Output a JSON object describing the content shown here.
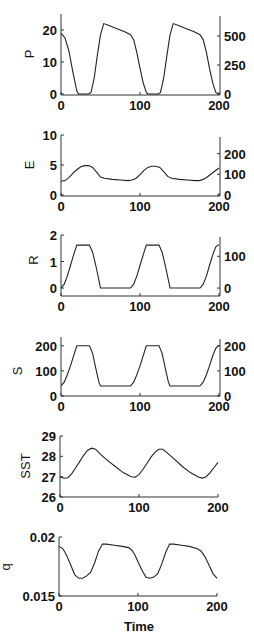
{
  "chart_data": [
    {
      "type": "line",
      "ylabel": "P",
      "xlabel": "",
      "xlim": [
        0,
        200
      ],
      "xticks": [
        0,
        100,
        200
      ],
      "ylim": [
        0,
        25
      ],
      "yticks": [
        0,
        10,
        20
      ],
      "right_axis": {
        "ylim": [
          0,
          690
        ],
        "yticks": [
          0,
          250,
          500
        ]
      },
      "x": [
        0,
        5,
        10,
        15,
        20,
        22,
        35,
        38,
        42,
        46,
        50,
        54,
        60,
        70,
        80,
        88,
        92,
        96,
        100,
        104,
        108,
        110,
        123,
        126,
        130,
        134,
        138,
        142,
        148,
        158,
        168,
        176,
        180,
        184,
        188,
        192,
        196,
        199
      ],
      "values": [
        19.0,
        17.5,
        13.5,
        7.0,
        1.0,
        0,
        0,
        0.5,
        5.0,
        12.0,
        18.5,
        22.0,
        21.5,
        20.5,
        19.5,
        18.5,
        17.0,
        13.0,
        8.0,
        3.5,
        0.5,
        0,
        0,
        0.5,
        5.0,
        12.0,
        18.5,
        22.0,
        21.5,
        20.5,
        19.5,
        18.5,
        17.0,
        13.0,
        8.0,
        3.5,
        0.5,
        0
      ]
    },
    {
      "type": "line",
      "ylabel": "E",
      "xlabel": "",
      "xlim": [
        0,
        200
      ],
      "xticks": [
        0,
        100,
        200
      ],
      "ylim": [
        0,
        10
      ],
      "yticks": [
        0,
        5,
        10
      ],
      "right_axis": {
        "ylim": [
          0,
          290
        ],
        "yticks": [
          0,
          100,
          200
        ]
      },
      "x": [
        0,
        5,
        10,
        15,
        20,
        25,
        30,
        35,
        40,
        45,
        50,
        55,
        65,
        75,
        85,
        90,
        95,
        100,
        105,
        110,
        115,
        120,
        125,
        130,
        135,
        140,
        150,
        160,
        170,
        175,
        180,
        185,
        190,
        195,
        200
      ],
      "values": [
        2.3,
        2.4,
        2.9,
        3.6,
        4.2,
        4.7,
        4.9,
        4.9,
        4.6,
        3.8,
        3.0,
        2.8,
        2.6,
        2.5,
        2.4,
        2.5,
        2.8,
        3.4,
        4.1,
        4.6,
        4.8,
        4.8,
        4.6,
        3.9,
        3.1,
        2.8,
        2.6,
        2.5,
        2.4,
        2.4,
        2.6,
        3.0,
        3.5,
        4.0,
        4.5
      ]
    },
    {
      "type": "line",
      "ylabel": "R",
      "xlabel": "",
      "xlim": [
        0,
        200
      ],
      "xticks": [
        0,
        100,
        200
      ],
      "ylim": [
        -0.3,
        2.0
      ],
      "yticks": [
        0,
        1,
        2
      ],
      "right_axis": {
        "ylim": [
          -25,
          167
        ],
        "yticks": [
          0,
          100
        ]
      },
      "x": [
        0,
        4,
        8,
        12,
        16,
        20,
        36,
        40,
        44,
        48,
        50,
        88,
        92,
        96,
        100,
        104,
        108,
        124,
        128,
        132,
        136,
        138,
        176,
        180,
        184,
        188,
        192,
        196,
        199,
        200
      ],
      "values": [
        0,
        0.15,
        0.45,
        0.85,
        1.25,
        1.62,
        1.62,
        1.35,
        0.85,
        0.3,
        0,
        0,
        0.15,
        0.45,
        0.85,
        1.25,
        1.62,
        1.62,
        1.35,
        0.85,
        0.3,
        0,
        0,
        0.15,
        0.45,
        0.85,
        1.25,
        1.55,
        1.62,
        1.62
      ]
    },
    {
      "type": "line",
      "ylabel": "S",
      "xlabel": "",
      "xlim": [
        0,
        200
      ],
      "xticks": [
        0,
        100,
        200
      ],
      "ylim": [
        0,
        235
      ],
      "yticks": [
        0,
        100,
        200
      ],
      "right_axis": {
        "ylim": [
          0,
          235
        ],
        "yticks": [
          0,
          100,
          200
        ]
      },
      "x": [
        0,
        4,
        8,
        12,
        16,
        20,
        36,
        40,
        44,
        48,
        50,
        88,
        92,
        96,
        100,
        104,
        108,
        124,
        128,
        132,
        136,
        138,
        176,
        180,
        184,
        188,
        192,
        196,
        199,
        200
      ],
      "values": [
        40,
        55,
        85,
        120,
        160,
        200,
        200,
        170,
        110,
        55,
        40,
        40,
        55,
        85,
        120,
        160,
        200,
        200,
        170,
        110,
        55,
        40,
        40,
        55,
        85,
        120,
        160,
        190,
        200,
        200
      ]
    },
    {
      "type": "line",
      "ylabel": "SST",
      "xlabel": "",
      "xlim": [
        0,
        200
      ],
      "xticks": [
        0,
        100,
        200
      ],
      "ylim": [
        26,
        29
      ],
      "yticks": [
        26,
        27,
        28,
        29
      ],
      "x": [
        0,
        5,
        10,
        15,
        20,
        25,
        30,
        35,
        40,
        45,
        50,
        60,
        70,
        80,
        90,
        95,
        100,
        105,
        110,
        115,
        120,
        125,
        130,
        135,
        145,
        155,
        165,
        175,
        180,
        185,
        190,
        195,
        200
      ],
      "values": [
        27.0,
        26.92,
        26.95,
        27.15,
        27.45,
        27.75,
        28.05,
        28.3,
        28.4,
        28.35,
        28.15,
        27.8,
        27.5,
        27.2,
        27.0,
        26.98,
        27.1,
        27.35,
        27.65,
        27.95,
        28.2,
        28.35,
        28.35,
        28.2,
        27.85,
        27.5,
        27.2,
        26.98,
        26.93,
        27.0,
        27.2,
        27.45,
        27.7
      ]
    },
    {
      "type": "line",
      "ylabel": "q",
      "xlabel": "Time",
      "xlim": [
        0,
        200
      ],
      "xticks": [
        0,
        100,
        200
      ],
      "ylim": [
        0.015,
        0.02
      ],
      "yticks": [
        0.015,
        0.02
      ],
      "x": [
        0,
        5,
        10,
        15,
        20,
        25,
        30,
        35,
        40,
        45,
        50,
        55,
        60,
        70,
        80,
        88,
        92,
        96,
        100,
        105,
        110,
        115,
        120,
        125,
        130,
        135,
        140,
        145,
        155,
        165,
        175,
        180,
        185,
        190,
        195,
        200
      ],
      "values": [
        0.0192,
        0.019,
        0.0184,
        0.0176,
        0.0168,
        0.0165,
        0.0165,
        0.0167,
        0.017,
        0.0178,
        0.0188,
        0.0194,
        0.0194,
        0.0193,
        0.0192,
        0.0191,
        0.0189,
        0.0185,
        0.0179,
        0.0172,
        0.0166,
        0.0165,
        0.0166,
        0.0169,
        0.0177,
        0.0187,
        0.0194,
        0.0194,
        0.0193,
        0.0192,
        0.019,
        0.0188,
        0.0183,
        0.0176,
        0.0169,
        0.0165
      ]
    }
  ],
  "panels": [
    {
      "ylabel": "P"
    },
    {
      "ylabel": "E"
    },
    {
      "ylabel": "R"
    },
    {
      "ylabel": "S"
    },
    {
      "ylabel": "SST"
    },
    {
      "ylabel": "q",
      "xlabel": "Time"
    }
  ],
  "style": {
    "line_color": "#222222",
    "axis_color": "#333333",
    "background": "#ffffff"
  }
}
